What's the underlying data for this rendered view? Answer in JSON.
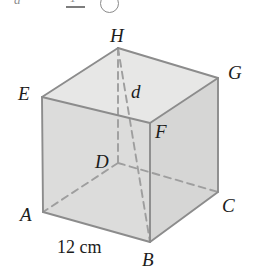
{
  "figure": {
    "shape": "cube",
    "colors": {
      "edge": "#8c8c8c",
      "hidden_edge": "#9a9a9a",
      "face_front": "#dededd",
      "face_top": "#e6e6e5",
      "face_right": "#d4d4d3",
      "label_text": "#1c1c1c",
      "background": "#ffffff"
    },
    "vertices": [
      {
        "name": "A",
        "label": "A",
        "x": 43,
        "y": 212,
        "hidden": false
      },
      {
        "name": "B",
        "label": "B",
        "x": 150,
        "y": 242,
        "hidden": false
      },
      {
        "name": "C",
        "label": "C",
        "x": 218,
        "y": 192,
        "hidden": false
      },
      {
        "name": "D",
        "label": "D",
        "x": 118,
        "y": 163,
        "hidden": true
      },
      {
        "name": "E",
        "label": "E",
        "x": 42,
        "y": 97,
        "hidden": false
      },
      {
        "name": "F",
        "label": "F",
        "x": 150,
        "y": 123,
        "hidden": false
      },
      {
        "name": "G",
        "label": "G",
        "x": 218,
        "y": 78,
        "hidden": false
      },
      {
        "name": "H",
        "label": "H",
        "x": 118,
        "y": 48,
        "hidden": false
      }
    ],
    "diagonal": {
      "label": "d",
      "from": "H",
      "to": "B",
      "style": "dashed"
    },
    "dimension": {
      "label": "12 cm",
      "value": 12,
      "unit": "cm",
      "edge": "AB"
    },
    "vertex_labels": {
      "H": "H",
      "G": "G",
      "E": "E",
      "F": "F",
      "D": "D",
      "A": "A",
      "C": "C",
      "B": "B",
      "d": "d"
    }
  },
  "header_fragments": {
    "italic_letter": "a",
    "fraction_numerator": "1",
    "circled_marker": ""
  }
}
